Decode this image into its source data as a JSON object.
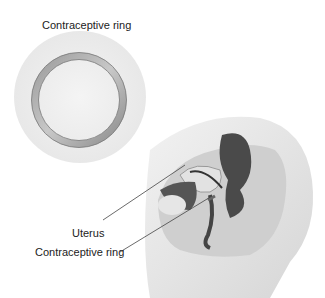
{
  "diagram": {
    "title": "Contraceptive ring",
    "labels": {
      "uterus": "Uterus",
      "ring": "Contraceptive ring"
    }
  }
}
